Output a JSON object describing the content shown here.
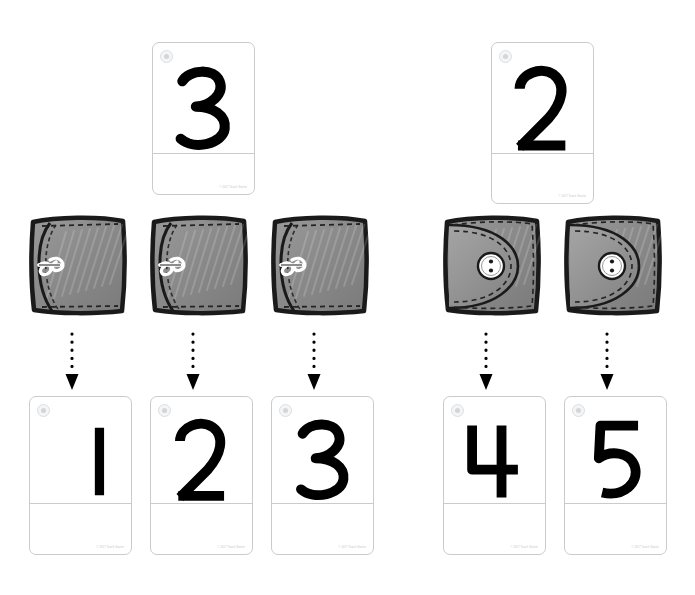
{
  "page": {
    "background_color": "#ffffff",
    "width": 695,
    "height": 595
  },
  "style": {
    "card_border_color": "#c9cbcd",
    "card_background": "#ffffff",
    "numeral_color": "#000000",
    "arrow_color": "#000000",
    "credit_color": "#bdbfc2",
    "purse_outline_color": "#1a1a1a",
    "purse_fill_color": "#8c8c8c",
    "button_color": "#ffffff"
  },
  "card_credit_text": "© 2017 Teach Starter",
  "logo_icon_name": "teach-starter-circle-logo",
  "groups": [
    {
      "name": "left-group",
      "answer_card": {
        "numeral": "3",
        "name": "answer-card-3",
        "x": 152,
        "y": 42,
        "width": 103,
        "height": 153,
        "divider_y": 110
      },
      "purse_type": "clasp-purse",
      "purse_count": 3,
      "purses": [
        {
          "name": "purse-clasp-1",
          "x": 26,
          "y": 212,
          "width": 104,
          "height": 106
        },
        {
          "name": "purse-clasp-2",
          "x": 147,
          "y": 212,
          "width": 104,
          "height": 106
        },
        {
          "name": "purse-clasp-3",
          "x": 268,
          "y": 212,
          "width": 104,
          "height": 106
        }
      ],
      "arrows": [
        {
          "name": "arrow-down-1",
          "x": 72,
          "y": 332,
          "height": 58
        },
        {
          "name": "arrow-down-2",
          "x": 193,
          "y": 332,
          "height": 58
        },
        {
          "name": "arrow-down-3",
          "x": 314,
          "y": 332,
          "height": 58
        }
      ],
      "number_cards": [
        {
          "numeral": "1",
          "name": "number-card-1",
          "x": 29,
          "y": 396,
          "width": 103,
          "height": 159,
          "divider_y": 106
        },
        {
          "numeral": "2",
          "name": "number-card-2",
          "x": 150,
          "y": 396,
          "width": 103,
          "height": 159,
          "divider_y": 106
        },
        {
          "numeral": "3",
          "name": "number-card-3",
          "x": 271,
          "y": 396,
          "width": 103,
          "height": 159,
          "divider_y": 106
        }
      ]
    },
    {
      "name": "right-group",
      "answer_card": {
        "numeral": "2",
        "name": "answer-card-2",
        "x": 491,
        "y": 42,
        "width": 103,
        "height": 162,
        "divider_y": 110
      },
      "purse_type": "button-purse",
      "purse_count": 2,
      "purses": [
        {
          "name": "purse-button-1",
          "x": 440,
          "y": 212,
          "width": 104,
          "height": 106
        },
        {
          "name": "purse-button-2",
          "x": 561,
          "y": 212,
          "width": 104,
          "height": 106
        }
      ],
      "arrows": [
        {
          "name": "arrow-down-4",
          "x": 486,
          "y": 332,
          "height": 58
        },
        {
          "name": "arrow-down-5",
          "x": 607,
          "y": 332,
          "height": 58
        }
      ],
      "number_cards": [
        {
          "numeral": "4",
          "name": "number-card-4",
          "x": 443,
          "y": 396,
          "width": 103,
          "height": 159,
          "divider_y": 106
        },
        {
          "numeral": "5",
          "name": "number-card-5",
          "x": 564,
          "y": 396,
          "width": 103,
          "height": 159,
          "divider_y": 106
        }
      ]
    }
  ]
}
